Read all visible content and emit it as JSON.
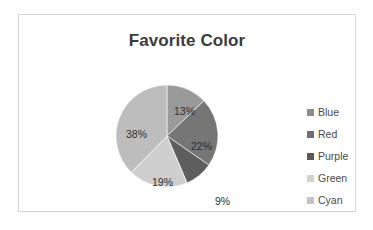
{
  "chart_data": {
    "type": "pie",
    "title": "Favorite Color",
    "categories": [
      "Blue",
      "Red",
      "Purple",
      "Green",
      "Cyan"
    ],
    "values": [
      13,
      22,
      9,
      19,
      38
    ],
    "data_labels": [
      "13%",
      "22%",
      "9%",
      "19%",
      "38%"
    ],
    "unit": "%",
    "start_angle_deg": 0,
    "direction": "clockwise",
    "legend_position": "right",
    "grid": false,
    "xlabel": "",
    "ylabel": "",
    "slice_colors": [
      "#9a9a9a",
      "#767676",
      "#5e5e5e",
      "#cfcfcf",
      "#bdbdbd"
    ],
    "legend_swatch_colors": [
      "#8c8c8c",
      "#6f6f6f",
      "#5a5a5a",
      "#d2d2d2",
      "#c2c2c2"
    ]
  },
  "frame": {
    "border_color": "#d6d6d6",
    "background": "#ffffff"
  },
  "title": {
    "text": "Favorite Color",
    "color": "#3b3b3b"
  },
  "legend": {
    "items": [
      {
        "label": "Blue",
        "swatch": "#8c8c8c"
      },
      {
        "label": "Red",
        "swatch": "#6f6f6f"
      },
      {
        "label": "Purple",
        "swatch": "#5a5a5a"
      },
      {
        "label": "Green",
        "swatch": "#d2d2d2"
      },
      {
        "label": "Cyan",
        "swatch": "#c2c2c2"
      }
    ]
  },
  "labels": {
    "blue": "13%",
    "red": "22%",
    "purple": "9%",
    "green": "19%",
    "cyan": "38%"
  }
}
